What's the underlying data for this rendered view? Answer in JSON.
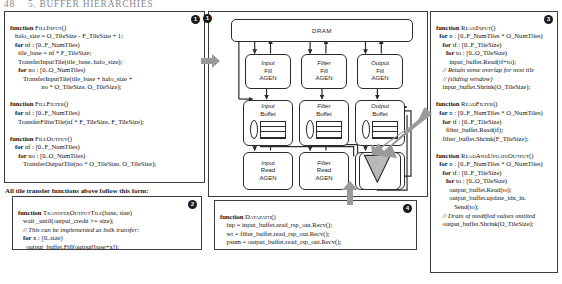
{
  "running_head": {
    "folio": "48",
    "title": "5. BUFFER HIERARCHIES"
  },
  "panels": {
    "fill": {
      "badge": "1",
      "name": "fill-functions-panel",
      "lines": [
        "function FILLINPUT()",
        "   halo_size = O_TileSize - F_TileSize + 1;",
        "   for nf : [0..F_NumTiles)",
        "     tile_base = nf * F_TileSize;",
        "     TransferInputTile(tile_base, halo_size);",
        "     for no : [0..O_NumTiles)",
        "        TransferInputTile(tile_base + halo_size +",
        "                   no * O_TileSize, O_TileSize);",
        "",
        "function FILLFILTER()",
        "   for nf : [0..F_NumTiles)",
        "     TransferFilterTile(nf * F_TileSize, F_TileSize);",
        "",
        "function FILLOUTPUT()",
        "   for nf : [0..F_NumTiles)",
        "     for no : [0..O_NumTiles)",
        "        TransferOutputTile(no * O_TileSize, O_TileSize);"
      ]
    },
    "transfer_caption": "All tile transfer functions above follow this form:",
    "transfer": {
      "badge": "2",
      "name": "transfer-output-tile-panel",
      "lines": [
        "function TRANSFEROUTPUTTILE(base, size)",
        "   wait _until(output_credit >= size);",
        "   // This can be implemented as bulk transfer:",
        "   for x : [0..size)",
        "     output_buffet.Fill(output[base+x]);",
        "   output_credit -= size;"
      ]
    },
    "read": {
      "badge": "3",
      "name": "read-functions-panel",
      "lines": [
        "function READINPUT()",
        "   for n : [0..F_NumTiles * O_NumTiles)",
        "     for tf : [0..F_TileSize)",
        "        for to : [0..O_TileSize)",
        "          input_buffet.Read(tf+to);",
        "     // Retain some overlap for next tile",
        "     // (sliding window)",
        "     input_buffet.Shrink(O_TileSize);",
        "",
        "function READFILTER()",
        "   for n : [0..F_NumTiles * O_NumTiles)",
        "     for tf : [0..F_TileSize)",
        "        filter_buffet.Read(tf);",
        "     filter_buffet.Shrink(F_TileSize);",
        "",
        "function READANDUPDATEOUTPUT()",
        "   for n : [0..F_NumTiles * O_NumTiles)",
        "     for tf : [0..F_TileSize)",
        "        for to : [0..O_TileSize)",
        "          output_buffet.Read(to);",
        "          output_buffet.update_idx_in.",
        "             Send(to);",
        "     // Drain of modified values omitted",
        "     output_buffet.Shrink(O_TileSize);"
      ]
    },
    "datapath": {
      "badge": "4",
      "name": "datapath-panel",
      "lines": [
        "function DATAPATH()",
        "   inp = input_buffet.read_rsp_out.Recv();",
        "   wt = filter_buffet.read_rsp_out.Recv();",
        "   psum = output_buffet.read_rsp_out.Recv();",
        "   psum += inp * wt;",
        "   output_buffet.update_data_in.Send(psum);"
      ]
    }
  },
  "diagram": {
    "badge": "1",
    "dram": "DRAM",
    "fill_agens": [
      {
        "kind": "Input",
        "l2": "Fill",
        "l3": "AGEN"
      },
      {
        "kind": "Filter",
        "l2": "Fill",
        "l3": "AGEN"
      },
      {
        "kind": "Output",
        "l2": "Fill",
        "l3": "AGEN"
      }
    ],
    "buffets": [
      {
        "kind": "Input",
        "l2": "Buffet"
      },
      {
        "kind": "Filter",
        "l2": "Buffet"
      },
      {
        "kind": "Output",
        "l2": "Buffet"
      }
    ],
    "read_agens": [
      {
        "kind": "Input",
        "l2": "Read",
        "l3": "AGEN"
      },
      {
        "kind": "Filter",
        "l2": "Read",
        "l3": "AGEN"
      },
      {
        "kind": "Output",
        "l2": "Rd/Up",
        "l3": "AGEN"
      }
    ]
  },
  "colors": {
    "ink": "#1a1a1a",
    "rule": "#2b2b2b",
    "fat_arrow": "#9a9a9a",
    "mac_fill": "#b9b9b9",
    "runhead": "#8a8a8a"
  }
}
